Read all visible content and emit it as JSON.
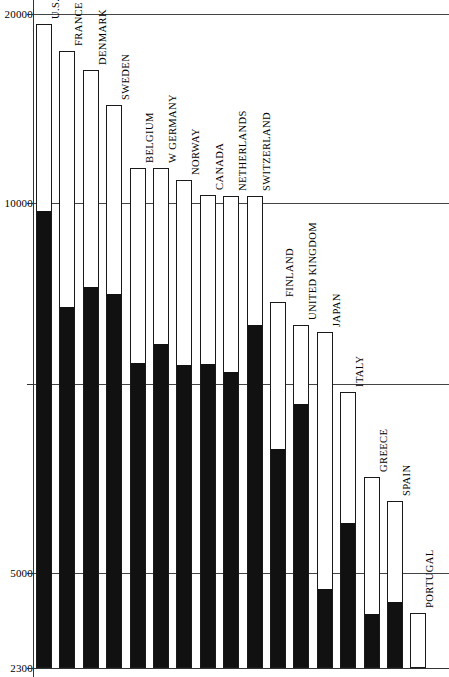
{
  "chart_data": {
    "type": "bar",
    "title": "",
    "subtitle": "",
    "xlabel": "",
    "ylabel": "",
    "scale": "log",
    "ylim": [
      2300,
      20000
    ],
    "grid": true,
    "legend_position": "none",
    "axis_ticks": [
      {
        "label": "20000",
        "value": 20000
      },
      {
        "label": "10000",
        "value": 10000
      },
      {
        "label": "5000",
        "value": 5000
      },
      {
        "label": "2300",
        "value": 2300
      }
    ],
    "unlabeled_gridlines": [
      7000
    ],
    "categories": [
      "U.S.",
      "FRANCE",
      "DENMARK",
      "SWEDEN",
      "BELGIUM",
      "W GERMANY",
      "NORWAY",
      "CANADA",
      "NETHERLANDS",
      "SWITZERLAND",
      "FINLAND",
      "UNITED KINGDOM",
      "JAPAN",
      "ITALY",
      "GREECE",
      "SPAIN",
      "PORTUGAL"
    ],
    "series": [
      {
        "name": "total",
        "values": [
          18200,
          15400,
          14200,
          11700,
          10100,
          10100,
          9500,
          8800,
          8700,
          8700,
          6600,
          6000,
          5850,
          4700,
          3950,
          3700,
          2750
        ]
      },
      {
        "name": "black-portion",
        "values": [
          9800,
          6900,
          7500,
          7300,
          5600,
          6200,
          5450,
          5550,
          5450,
          6800,
          4300,
          5000,
          2850,
          3350,
          2600,
          2700,
          2330
        ]
      }
    ]
  },
  "bars": [
    {
      "name": "U.S.",
      "top": 24,
      "black_top": 212
    },
    {
      "name": "FRANCE",
      "top": 51,
      "black_top": 308
    },
    {
      "name": "DENMARK",
      "top": 70,
      "black_top": 288
    },
    {
      "name": "SWEDEN",
      "top": 105,
      "black_top": 295
    },
    {
      "name": "BELGIUM",
      "top": 168,
      "black_top": 364
    },
    {
      "name": "W GERMANY",
      "top": 168,
      "black_top": 345
    },
    {
      "name": "NORWAY",
      "top": 180,
      "black_top": 366
    },
    {
      "name": "CANADA",
      "top": 195,
      "black_top": 365
    },
    {
      "name": "NETHERLANDS",
      "top": 196,
      "black_top": 373
    },
    {
      "name": "SWITZERLAND",
      "top": 196,
      "black_top": 326
    },
    {
      "name": "FINLAND",
      "top": 302,
      "black_top": 450
    },
    {
      "name": "UNITED KINGDOM",
      "top": 325,
      "black_top": 405
    },
    {
      "name": "JAPAN",
      "top": 332,
      "black_top": 590
    },
    {
      "name": "ITALY",
      "top": 392,
      "black_top": 524
    },
    {
      "name": "GREECE",
      "top": 477,
      "black_top": 615
    },
    {
      "name": "SPAIN",
      "top": 501,
      "black_top": 603
    },
    {
      "name": "PORTUGAL",
      "top": 613,
      "black_top": 670
    }
  ],
  "gridlines": [
    {
      "y": 14,
      "label": "20000"
    },
    {
      "y": 203,
      "label": "10000"
    },
    {
      "y": 384,
      "label": ""
    },
    {
      "y": 573,
      "label": "5000"
    },
    {
      "y": 668,
      "label": "2300"
    }
  ],
  "layout": {
    "bar_left_start": 36,
    "bar_pitch": 23.4,
    "bar_width": 16,
    "baseline_y": 668,
    "label_gap": 5
  }
}
